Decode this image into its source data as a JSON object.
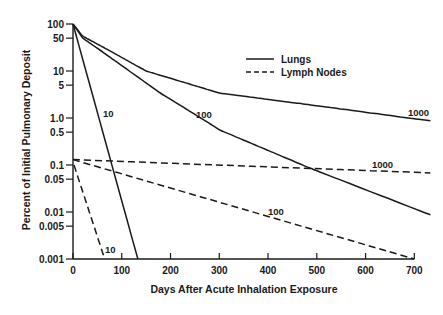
{
  "chart_data": {
    "type": "line",
    "title": "",
    "xlabel": "Days After Acute Inhalation Exposure",
    "ylabel": "Percent of Initial Pulmonary Deposit",
    "xlim": [
      0,
      700
    ],
    "ylim": [
      0.001,
      100
    ],
    "yscale": "log",
    "grid": false,
    "legend_position": "upper-right",
    "x_ticks": [
      0,
      100,
      200,
      300,
      400,
      500,
      600,
      700
    ],
    "y_ticks": [
      {
        "value": 100,
        "label": "100"
      },
      {
        "value": 50,
        "label": "50"
      },
      {
        "value": 10,
        "label": "10"
      },
      {
        "value": 5,
        "label": "5"
      },
      {
        "value": 1,
        "label": "1.0"
      },
      {
        "value": 0.5,
        "label": "0.5"
      },
      {
        "value": 0.1,
        "label": "0.1"
      },
      {
        "value": 0.05,
        "label": "0.05"
      },
      {
        "value": 0.01,
        "label": "0.01"
      },
      {
        "value": 0.005,
        "label": "0.005"
      },
      {
        "value": 0.001,
        "label": "0.001"
      }
    ],
    "legend": [
      {
        "name": "Lungs",
        "style": "solid"
      },
      {
        "name": "Lymph Nodes",
        "style": "dashed"
      }
    ],
    "series": [
      {
        "name": "Lungs 1000",
        "group": "Lungs",
        "label": "1000",
        "style": "solid",
        "x": [
          0,
          20,
          62,
          150,
          300,
          487,
          733
        ],
        "y": [
          100,
          55,
          32,
          10,
          3.4,
          1.9,
          0.87
        ],
        "label_pos": [
          408,
          116
        ]
      },
      {
        "name": "Lungs 100",
        "group": "Lungs",
        "label": "100",
        "style": "solid",
        "x": [
          0,
          20,
          55,
          179,
          302,
          487,
          733
        ],
        "y": [
          100,
          50,
          28,
          3.4,
          0.55,
          0.085,
          0.0087
        ],
        "label_pos": [
          196,
          118
        ]
      },
      {
        "name": "Lungs 10",
        "group": "Lungs",
        "label": "10",
        "style": "solid",
        "x": [
          0,
          133
        ],
        "y": [
          100,
          0.001
        ],
        "label_pos": [
          103,
          117
        ]
      },
      {
        "name": "Lymph Nodes 1000",
        "group": "Lymph Nodes",
        "label": "1000",
        "style": "dashed",
        "x": [
          0,
          733
        ],
        "y": [
          0.13,
          0.068
        ],
        "label_pos": [
          372,
          168
        ]
      },
      {
        "name": "Lymph Nodes 100",
        "group": "Lymph Nodes",
        "label": "100",
        "style": "dashed",
        "x": [
          0,
          700
        ],
        "y": [
          0.13,
          0.001
        ],
        "label_pos": [
          268,
          215
        ]
      },
      {
        "name": "Lymph Nodes 10",
        "group": "Lymph Nodes",
        "label": "10",
        "style": "dashed",
        "x": [
          2,
          65
        ],
        "y": [
          0.1,
          0.001
        ],
        "label_pos": [
          105,
          253
        ]
      }
    ]
  }
}
